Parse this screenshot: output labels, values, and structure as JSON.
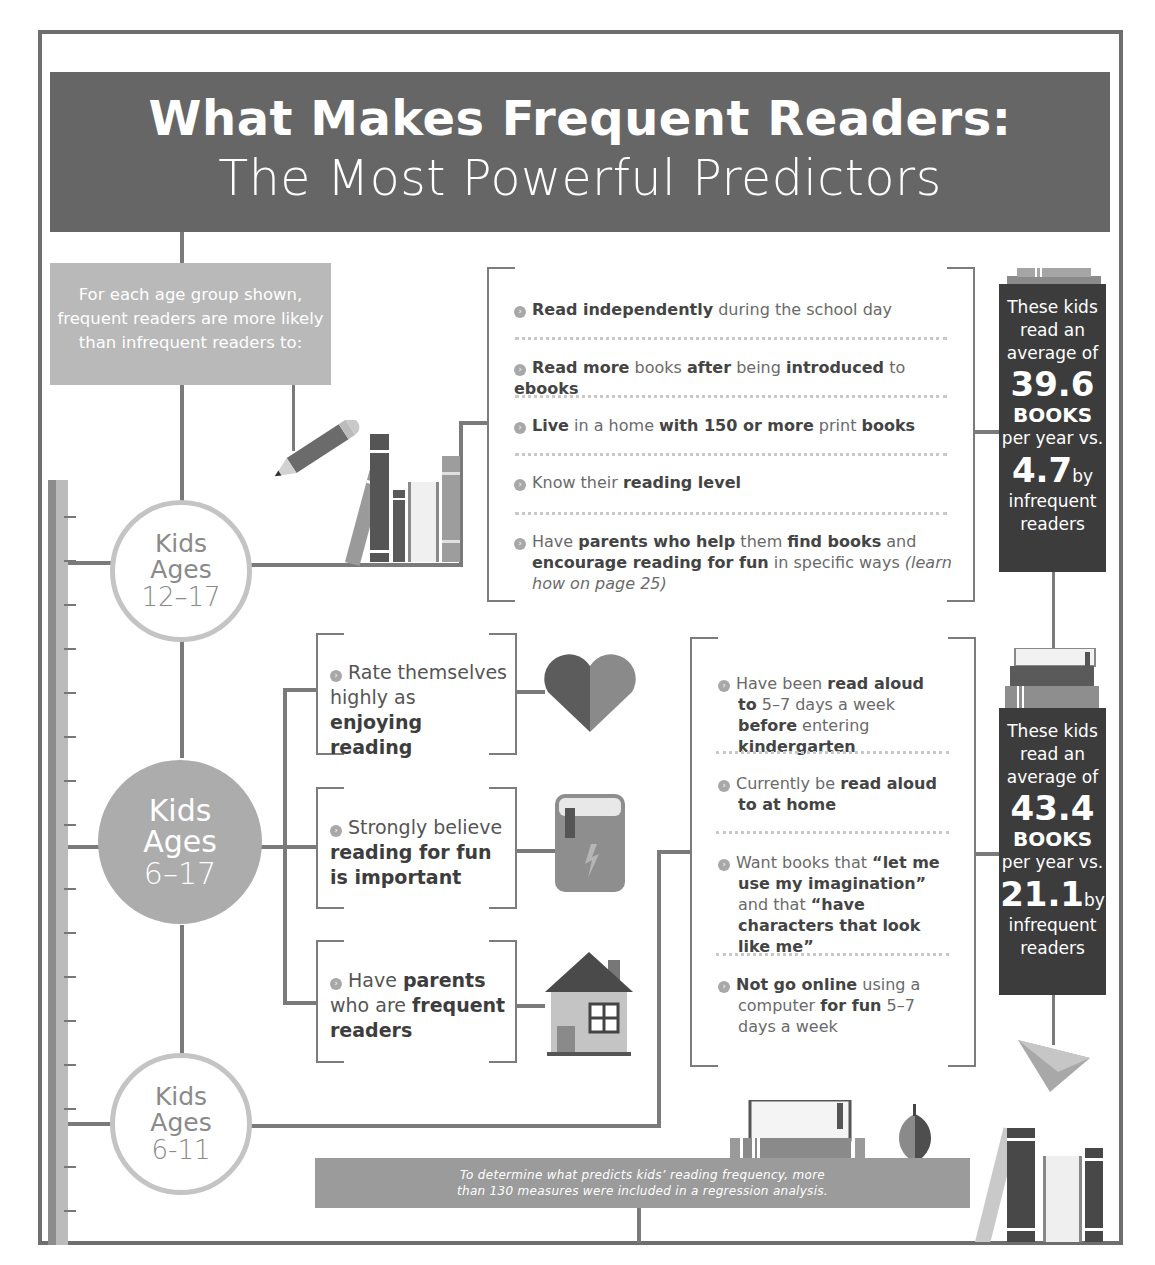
{
  "header": {
    "title": "What Makes Frequent Readers:",
    "subtitle": "The Most Powerful Predictors"
  },
  "intro": {
    "text": "For each age group shown, frequent readers are more likely than infrequent readers to:"
  },
  "age_groups": [
    {
      "kids": "Kids",
      "ages": "Ages",
      "range": "12–17"
    },
    {
      "kids": "Kids",
      "ages": "Ages",
      "range": "6–17"
    },
    {
      "kids": "Kids",
      "ages": "Ages",
      "range": "6-11"
    }
  ],
  "group_12_17": {
    "items": [
      {
        "parts": [
          [
            "b",
            "Read independently"
          ],
          [
            "n",
            " during the  school day"
          ]
        ]
      },
      {
        "parts": [
          [
            "b",
            "Read more"
          ],
          [
            "n",
            " books "
          ],
          [
            "b",
            "after"
          ],
          [
            "n",
            " being "
          ],
          [
            "b",
            "introduced"
          ],
          [
            "n",
            " to "
          ],
          [
            "b",
            "ebooks"
          ]
        ]
      },
      {
        "parts": [
          [
            "b",
            "Live"
          ],
          [
            "n",
            " in a home "
          ],
          [
            "b",
            "with 150 or more"
          ],
          [
            "n",
            " print "
          ],
          [
            "b",
            "books"
          ]
        ]
      },
      {
        "parts": [
          [
            "n",
            "Know their "
          ],
          [
            "b",
            "reading level"
          ]
        ]
      },
      {
        "parts": [
          [
            "n",
            "Have "
          ],
          [
            "b",
            "parents who help"
          ],
          [
            "n",
            " them "
          ],
          [
            "b",
            "find books"
          ],
          [
            "n",
            " and "
          ],
          [
            "b",
            "encourage reading for fun"
          ],
          [
            "n",
            " in specific ways "
          ],
          [
            "i",
            "(learn how on page 25)"
          ]
        ]
      }
    ],
    "stat": {
      "line1": "These kids",
      "line2": "read an",
      "line3": "average of",
      "frequent": "39.6",
      "books": "BOOKS",
      "per_year": "per year vs.",
      "infrequent": "4.7",
      "by": "by",
      "infrequent_label1": "infrequent",
      "infrequent_label2": "readers"
    }
  },
  "group_6_17": {
    "items": [
      {
        "parts": [
          [
            "n",
            "Rate themselves highly as "
          ],
          [
            "b",
            "enjoying reading"
          ]
        ],
        "icon": "heart-icon"
      },
      {
        "parts": [
          [
            "n",
            "Strongly believe "
          ],
          [
            "b",
            "reading for fun is important"
          ]
        ],
        "icon": "book-icon"
      },
      {
        "parts": [
          [
            "n",
            "Have "
          ],
          [
            "b",
            "parents"
          ],
          [
            "n",
            " who are "
          ],
          [
            "b",
            "frequent readers"
          ]
        ],
        "icon": "house-icon"
      }
    ]
  },
  "group_6_11": {
    "items": [
      {
        "parts": [
          [
            "n",
            "Have been "
          ],
          [
            "b",
            "read aloud to"
          ],
          [
            "n",
            " 5–7 days a week "
          ],
          [
            "b",
            "before"
          ],
          [
            "n",
            " entering "
          ],
          [
            "b",
            "kindergarten"
          ]
        ]
      },
      {
        "parts": [
          [
            "n",
            "Currently be "
          ],
          [
            "b",
            "read aloud to at home"
          ]
        ]
      },
      {
        "parts": [
          [
            "n",
            "Want books that "
          ],
          [
            "b",
            "“let me use my imagination”"
          ],
          [
            "n",
            " and that "
          ],
          [
            "b",
            "“have characters that look like me”"
          ]
        ]
      },
      {
        "parts": [
          [
            "b",
            "Not go online"
          ],
          [
            "n",
            " using a computer "
          ],
          [
            "b",
            "for fun"
          ],
          [
            "n",
            " 5–7 days a week"
          ]
        ]
      }
    ],
    "stat": {
      "line1": "These kids",
      "line2": "read an",
      "line3": "average of",
      "frequent": "43.4",
      "books": "BOOKS",
      "per_year": "per year vs.",
      "infrequent": "21.1",
      "by": "by",
      "infrequent_label1": "infrequent",
      "infrequent_label2": "readers"
    }
  },
  "footer": {
    "line1": "To determine what predicts kids’ reading frequency, more",
    "line2": "than 130 measures were included in a regression analysis."
  },
  "colors": {
    "header_bg": "#666666",
    "stat_bg": "#3c3c3c",
    "intro_bg": "#b9b9b9",
    "footer_bg": "#9b9b9b",
    "line": "#7a7a7a"
  }
}
